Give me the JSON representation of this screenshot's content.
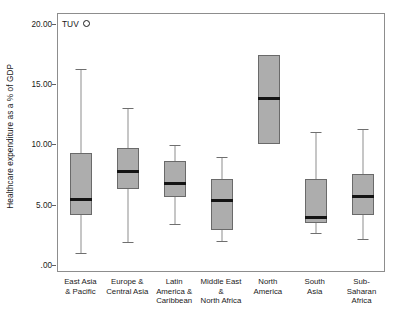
{
  "chart_data": {
    "type": "box",
    "title": "",
    "xlabel": "",
    "ylabel": "Healthcare expenditure as a % of GDP",
    "ylim": [
      0,
      21.15
    ],
    "grid": false,
    "legend": null,
    "ytick_labels": [
      ".00",
      "5.00",
      "10.00",
      "15.00",
      "20.00"
    ],
    "ytick_values": [
      0,
      5,
      10,
      15,
      20
    ],
    "categories": [
      "East Asia\n& Pacific",
      "Europe &\nCentral Asia",
      "Latin\nAmerica &\nCaribbean",
      "Middle East\n&\nNorth Africa",
      "North\nAmerica",
      "South\nAsia",
      "Sub-\nSaharan\nAfrica"
    ],
    "boxes": [
      {
        "category": "East Asia & Pacific",
        "whisker_low": 1.1,
        "q1": 4.2,
        "median": 5.5,
        "q3": 9.4,
        "whisker_high": 16.3
      },
      {
        "category": "Europe & Central Asia",
        "whisker_low": 2.0,
        "q1": 6.4,
        "median": 7.8,
        "q3": 9.8,
        "whisker_high": 13.1
      },
      {
        "category": "Latin America & Caribbean",
        "whisker_low": 3.5,
        "q1": 5.7,
        "median": 6.8,
        "q3": 8.7,
        "whisker_high": 10.0
      },
      {
        "category": "Middle East & North Africa",
        "whisker_low": 2.1,
        "q1": 3.0,
        "median": 5.4,
        "q3": 7.2,
        "whisker_high": 9.0
      },
      {
        "category": "North America",
        "whisker_low": 10.1,
        "q1": 10.1,
        "median": 13.9,
        "q3": 17.5,
        "whisker_high": 17.5
      },
      {
        "category": "South Asia",
        "whisker_low": 2.7,
        "q1": 3.6,
        "median": 4.0,
        "q3": 7.2,
        "whisker_high": 11.1
      },
      {
        "category": "Sub-Saharan Africa",
        "whisker_low": 2.2,
        "q1": 4.2,
        "median": 5.8,
        "q3": 7.6,
        "whisker_high": 11.4
      }
    ],
    "annotations": [
      {
        "label": "TUV",
        "marker": "open-circle",
        "value": 20.0,
        "category": "East Asia & Pacific"
      }
    ]
  }
}
